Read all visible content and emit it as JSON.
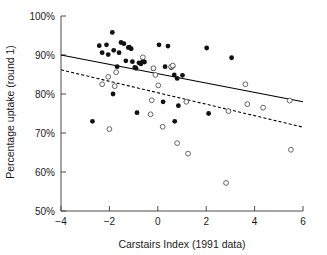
{
  "chart_data": {
    "type": "scatter",
    "title": "",
    "xlabel": "Carstairs Index (1991 data)",
    "ylabel": "Percentage uptake (round 1)",
    "xlim": [
      -4,
      6
    ],
    "ylim": [
      50,
      100
    ],
    "xticks": [
      -4,
      -2,
      0,
      2,
      4,
      6
    ],
    "xtick_labels": [
      "−4",
      "−2",
      "0",
      "2",
      "4",
      "6"
    ],
    "yticks": [
      50,
      60,
      70,
      80,
      90,
      100
    ],
    "ytick_labels": [
      "50%",
      "60%",
      "70%",
      "80%",
      "90%",
      "100%"
    ],
    "grid": false,
    "legend": "none",
    "series": [
      {
        "name": "filled-circles",
        "marker": "filled circle",
        "color": "#111111",
        "points": [
          [
            -2.7,
            73.0
          ],
          [
            -2.42,
            92.4
          ],
          [
            -2.3,
            90.6
          ],
          [
            -2.12,
            92.6
          ],
          [
            -2.05,
            90.1
          ],
          [
            -1.88,
            95.8
          ],
          [
            -1.85,
            80.0
          ],
          [
            -1.82,
            91.2
          ],
          [
            -1.68,
            87.0
          ],
          [
            -1.6,
            90.6
          ],
          [
            -1.52,
            93.2
          ],
          [
            -1.4,
            92.9
          ],
          [
            -1.32,
            88.5
          ],
          [
            -1.22,
            91.9
          ],
          [
            -1.18,
            92.0
          ],
          [
            -1.1,
            91.6
          ],
          [
            -1.05,
            88.3
          ],
          [
            -0.95,
            86.8
          ],
          [
            -0.9,
            86.6
          ],
          [
            -0.86,
            75.2
          ],
          [
            -0.78,
            88.0
          ],
          [
            -0.7,
            87.7
          ],
          [
            -0.62,
            88.4
          ],
          [
            -0.55,
            88.2
          ],
          [
            -0.18,
            86.5
          ],
          [
            0.05,
            92.6
          ],
          [
            0.22,
            78.0
          ],
          [
            0.3,
            87.0
          ],
          [
            0.42,
            92.3
          ],
          [
            0.55,
            86.8
          ],
          [
            0.62,
            87.1
          ],
          [
            0.68,
            84.9
          ],
          [
            0.7,
            73.0
          ],
          [
            0.8,
            84.0
          ],
          [
            0.85,
            77.0
          ],
          [
            1.02,
            84.8
          ],
          [
            2.02,
            91.8
          ],
          [
            2.1,
            75.0
          ],
          [
            3.05,
            89.3
          ]
        ]
      },
      {
        "name": "open-circles",
        "marker": "open circle",
        "color": "#ffffff",
        "points": [
          [
            -2.3,
            82.5
          ],
          [
            -2.05,
            84.4
          ],
          [
            -2.0,
            71.0
          ],
          [
            -1.78,
            82.0
          ],
          [
            -1.72,
            85.6
          ],
          [
            -0.62,
            89.4
          ],
          [
            -0.3,
            74.8
          ],
          [
            -0.25,
            78.4
          ],
          [
            -0.18,
            86.6
          ],
          [
            -0.1,
            84.9
          ],
          [
            0.02,
            82.2
          ],
          [
            0.2,
            71.6
          ],
          [
            0.55,
            87.0
          ],
          [
            0.62,
            87.3
          ],
          [
            0.8,
            67.4
          ],
          [
            1.18,
            78.0
          ],
          [
            1.25,
            64.7
          ],
          [
            2.82,
            57.2
          ],
          [
            2.92,
            75.6
          ],
          [
            3.62,
            82.5
          ],
          [
            3.7,
            77.4
          ],
          [
            4.35,
            76.5
          ],
          [
            5.45,
            78.3
          ],
          [
            5.5,
            65.7
          ]
        ]
      }
    ],
    "fit_lines": [
      {
        "name": "solid-fit-line",
        "style": "solid",
        "color": "#000000",
        "x_start": -4,
        "y_start": 90.0,
        "x_end": 6,
        "y_end": 78.0
      },
      {
        "name": "dashed-fit-line",
        "style": "dashed",
        "color": "#000000",
        "x_start": -4,
        "y_start": 86.2,
        "x_end": 6,
        "y_end": 71.5
      }
    ]
  }
}
